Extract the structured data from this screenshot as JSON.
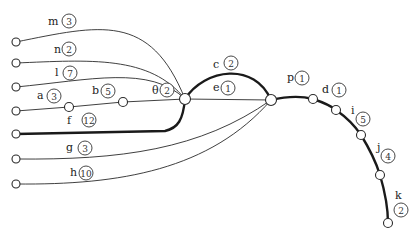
{
  "diagram": {
    "type": "weighted-tree-network",
    "junction_nodes": [
      "left-junction",
      "right-junction"
    ],
    "edges": [
      {
        "id": "m",
        "label": "m",
        "weight": "3",
        "bold": false
      },
      {
        "id": "n",
        "label": "n",
        "weight": "2",
        "bold": false
      },
      {
        "id": "l",
        "label": "l",
        "weight": "7",
        "bold": false
      },
      {
        "id": "a",
        "label": "a",
        "weight": "3",
        "bold": false
      },
      {
        "id": "b",
        "label": "b",
        "weight": "5",
        "bold": false
      },
      {
        "id": "theta",
        "label": "θ",
        "weight": "2",
        "bold": false
      },
      {
        "id": "f",
        "label": "f",
        "weight": "12",
        "bold": true
      },
      {
        "id": "g",
        "label": "g",
        "weight": "3",
        "bold": false
      },
      {
        "id": "h",
        "label": "h",
        "weight": "10",
        "bold": false
      },
      {
        "id": "c",
        "label": "c",
        "weight": "2",
        "bold": true
      },
      {
        "id": "e",
        "label": "e",
        "weight": "1",
        "bold": false
      },
      {
        "id": "p",
        "label": "p",
        "weight": "1",
        "bold": true
      },
      {
        "id": "d",
        "label": "d",
        "weight": "1",
        "bold": true
      },
      {
        "id": "i",
        "label": "i",
        "weight": "5",
        "bold": true
      },
      {
        "id": "j",
        "label": "j",
        "weight": "4",
        "bold": true
      },
      {
        "id": "k",
        "label": "k",
        "weight": "2",
        "bold": true
      }
    ]
  }
}
